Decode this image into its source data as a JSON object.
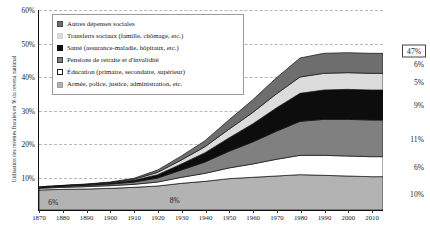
{
  "chart_data": {
    "type": "area",
    "stacked": true,
    "title": "",
    "xlabel": "",
    "ylabel": "Utilisation des recettes fiscales en % du revenu national",
    "x": [
      1870,
      1880,
      1890,
      1900,
      1910,
      1920,
      1930,
      1940,
      1950,
      1960,
      1970,
      1980,
      1990,
      2000,
      2010
    ],
    "xticks": [
      "1870",
      "1880",
      "1890",
      "1900",
      "1910",
      "1920",
      "1930",
      "1940",
      "1950",
      "1960",
      "1970",
      "1980",
      "1990",
      "2000",
      "2010"
    ],
    "yticks": [
      "10%",
      "20%",
      "30%",
      "40%",
      "50%",
      "60%"
    ],
    "ylim": [
      0,
      60
    ],
    "xlim": [
      1870,
      2015
    ],
    "grid": true,
    "legend_position": "top-left",
    "series": [
      {
        "name": "Armée, police, justice, administration, etc.",
        "color": "#b3b3b3",
        "values": [
          6.0,
          6.2,
          6.3,
          6.5,
          6.8,
          7.2,
          8.0,
          8.6,
          9.4,
          9.8,
          10.2,
          10.6,
          10.4,
          10.2,
          10.0
        ],
        "end_label": "10%"
      },
      {
        "name": "Éducation (primaire, secondaire, supérieur)",
        "color": "#ffffff",
        "values": [
          0.5,
          0.6,
          0.7,
          0.8,
          0.9,
          1.2,
          1.8,
          2.4,
          3.2,
          4.0,
          5.0,
          5.8,
          6.0,
          6.0,
          6.0
        ],
        "end_label": "6%"
      },
      {
        "name": "Pensions de retraite et d'invalidité",
        "color": "#808080",
        "values": [
          0.2,
          0.3,
          0.4,
          0.5,
          0.7,
          1.2,
          2.2,
          3.4,
          5.0,
          6.6,
          8.4,
          10.2,
          10.8,
          11.0,
          11.0
        ],
        "end_label": "11%"
      },
      {
        "name": "Santé (assurance-maladie, hôpitaux, etc.)",
        "color": "#0d0d0d",
        "values": [
          0.1,
          0.15,
          0.2,
          0.3,
          0.5,
          1.0,
          1.8,
          2.8,
          4.0,
          5.4,
          7.0,
          8.4,
          8.8,
          9.0,
          9.0
        ],
        "end_label": "9%"
      },
      {
        "name": "Transferts sociaux (famille, chômage, etc.)",
        "color": "#dcdcdc",
        "values": [
          0.05,
          0.08,
          0.1,
          0.15,
          0.3,
          0.7,
          1.2,
          1.8,
          2.6,
          3.4,
          4.2,
          4.9,
          5.0,
          5.0,
          5.0
        ],
        "end_label": "5%"
      },
      {
        "name": "Autres dépenses sociales",
        "color": "#6e6e6e",
        "values": [
          0.05,
          0.07,
          0.1,
          0.15,
          0.3,
          0.7,
          1.2,
          1.8,
          2.8,
          3.8,
          4.8,
          5.7,
          6.0,
          6.0,
          6.0
        ],
        "end_label": "6%"
      }
    ],
    "total_label": "47%",
    "annotations": [
      {
        "text": "6%",
        "x": 1876,
        "y": 2.6
      },
      {
        "text": "8%",
        "x": 1927,
        "y": 3.4
      },
      {
        "text": "1%",
        "x": 1874,
        "y": 7.4
      }
    ]
  },
  "legend": {
    "items": [
      {
        "label": "Autres dépenses sociales",
        "swatch": "#6e6e6e",
        "border": "#4a4a4a"
      },
      {
        "label": "Transferts sociaux (famille, chômage, etc.)",
        "swatch": "#dcdcdc",
        "border": "#cfcfcf"
      },
      {
        "label": "Santé (assurance-maladie, hôpitaux, etc.)",
        "swatch": "#0d0d0d",
        "border": "#0d0d0d"
      },
      {
        "label": "Pensions de retraite et d'invalidité",
        "swatch": "#808080",
        "border": "#3a3a3a"
      },
      {
        "label": "Éducation (primaire, secondaire, supérieur)",
        "swatch": "#ffffff",
        "border": "#222222"
      },
      {
        "label": "Armée, police, justice, administration, etc.",
        "swatch": "#b3b3b3",
        "border": "#a0a0a0"
      }
    ]
  }
}
